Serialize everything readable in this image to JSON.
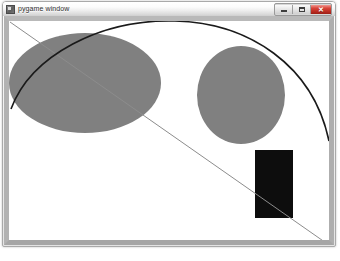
{
  "window": {
    "title": "pygame window",
    "icon": "pygame-app-icon",
    "buttons": {
      "minimize_label": "–",
      "maximize_label": "❐",
      "close_label": "✕"
    }
  },
  "canvas": {
    "background_color": "#ffffff",
    "width": 320,
    "height": 219,
    "shapes": [
      {
        "name": "ellipse-left",
        "type": "ellipse",
        "cx": 76,
        "cy": 62,
        "rx": 76,
        "ry": 50,
        "fill": "#808080"
      },
      {
        "name": "ellipse-right",
        "type": "ellipse",
        "cx": 232,
        "cy": 74,
        "rx": 44,
        "ry": 49,
        "fill": "#808080"
      },
      {
        "name": "rectangle-black",
        "type": "rect",
        "x": 246,
        "y": 129,
        "width": 38,
        "height": 68,
        "fill": "#0d0d0d"
      },
      {
        "name": "diagonal-line",
        "type": "line",
        "x1": 1,
        "y1": 1,
        "x2": 320,
        "y2": 224,
        "stroke": "#8c8c8c",
        "stroke_width": 1
      },
      {
        "name": "arc-curve",
        "type": "path",
        "d": "M 2 88 C 22 34 92 -2 166 0 C 240 2 304 44 320 120",
        "stroke": "#1a1a1a",
        "stroke_width": 1.6
      }
    ]
  }
}
